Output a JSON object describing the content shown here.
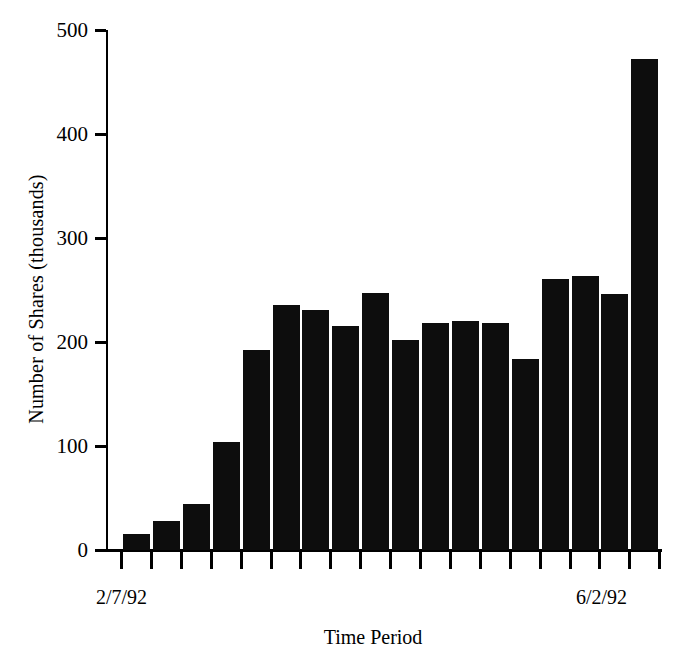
{
  "chart_data": {
    "type": "bar",
    "title": "",
    "xlabel": "Time Period",
    "ylabel": "Number of Shares (thousands)",
    "ylim": [
      0,
      500
    ],
    "yticks": [
      0,
      100,
      200,
      300,
      400,
      500
    ],
    "ytick_labels": [
      "0",
      "100",
      "200",
      "300",
      "400",
      "500"
    ],
    "grid": false,
    "legend": null,
    "x_axis_endpoint_labels": [
      "2/7/92",
      "6/2/92"
    ],
    "bar_color": "#0d0d0d",
    "n_bars": 18,
    "categories": [
      "1",
      "2",
      "3",
      "4",
      "5",
      "6",
      "7",
      "8",
      "9",
      "10",
      "11",
      "12",
      "13",
      "14",
      "15",
      "16",
      "17",
      "18"
    ],
    "values": [
      15,
      28,
      44,
      104,
      192,
      236,
      231,
      215,
      247,
      202,
      218,
      220,
      218,
      184,
      261,
      263,
      246,
      472
    ]
  },
  "axis": {
    "y_label": "Number of Shares (thousands)",
    "x_label": "Time Period",
    "x_start": "2/7/92",
    "x_end": "6/2/92"
  }
}
